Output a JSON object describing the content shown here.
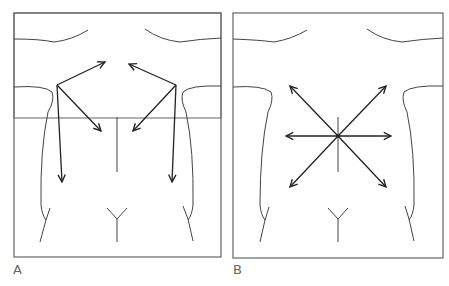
{
  "figure": {
    "panels": [
      {
        "id": "A",
        "label": "A",
        "description": "Torso outline with arrows directed upward toward center and downward along flanks"
      },
      {
        "id": "B",
        "label": "B",
        "description": "Torso outline with radial arrows from central point (umbilicus) in six directions"
      }
    ]
  },
  "colors": {
    "outline": "#555555",
    "arrow": "#222222",
    "background": "#ffffff"
  }
}
